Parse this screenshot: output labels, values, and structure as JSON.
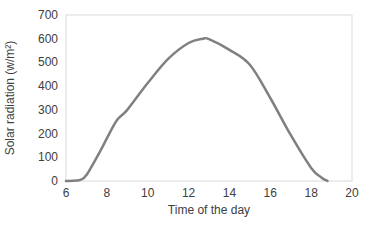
{
  "chart_data": {
    "type": "line",
    "title": "",
    "xlabel": "Time of the day",
    "ylabel": "Solar radiation (w/m²)",
    "xlim": [
      6,
      20
    ],
    "ylim": [
      0,
      700
    ],
    "xticks": [
      6,
      8,
      10,
      12,
      14,
      16,
      18,
      20
    ],
    "yticks": [
      0,
      100,
      200,
      300,
      400,
      500,
      600,
      700
    ],
    "grid": false,
    "legend": null,
    "series": [
      {
        "name": "Solar radiation",
        "color": "#808080",
        "x": [
          6,
          6.5,
          6.7,
          7,
          7.7,
          8,
          8.5,
          9,
          10,
          11,
          12,
          12.7,
          13,
          14,
          15,
          16,
          17,
          18,
          18.5,
          18.8
        ],
        "y": [
          0,
          2,
          5,
          25,
          130,
          180,
          257,
          300,
          413,
          515,
          582,
          600,
          598,
          553,
          490,
          350,
          194,
          55,
          15,
          0
        ]
      }
    ]
  }
}
